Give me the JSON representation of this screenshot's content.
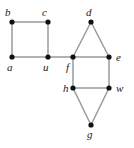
{
  "figure": {
    "name": "undirected-graph-diagram",
    "background_color": "#ffffff",
    "edge_color": "#9a9a9a",
    "vertex_color": "#111111",
    "label_color": "#1a1a1a",
    "vertex_radius": 2.6,
    "width": 134,
    "height": 148
  },
  "chart_data": {
    "type": "diagram",
    "title": "",
    "graph": {
      "kind": "undirected",
      "vertex_count": 9,
      "edge_count": 11,
      "vertices": [
        {
          "id": "a",
          "label": "a",
          "x": 12,
          "y": 57,
          "label_x": 7,
          "label_y": 62,
          "label_anchor": "below-left"
        },
        {
          "id": "b",
          "label": "b",
          "x": 12,
          "y": 22,
          "label_x": 5,
          "label_y": 7,
          "label_anchor": "above-left"
        },
        {
          "id": "c",
          "label": "c",
          "x": 48,
          "y": 22,
          "label_x": 42,
          "label_y": 7,
          "label_anchor": "above-left"
        },
        {
          "id": "u",
          "label": "u",
          "x": 48,
          "y": 57,
          "label_x": 43,
          "label_y": 62,
          "label_anchor": "below-left"
        },
        {
          "id": "f",
          "label": "f",
          "x": 73,
          "y": 57,
          "label_x": 66,
          "label_y": 62,
          "label_anchor": "below-left"
        },
        {
          "id": "d",
          "label": "d",
          "x": 91,
          "y": 22,
          "label_x": 86,
          "label_y": 7,
          "label_anchor": "above"
        },
        {
          "id": "e",
          "label": "e",
          "x": 109,
          "y": 57,
          "label_x": 116,
          "label_y": 52,
          "label_anchor": "right"
        },
        {
          "id": "h",
          "label": "h",
          "x": 73,
          "y": 88,
          "label_x": 63,
          "label_y": 83,
          "label_anchor": "left"
        },
        {
          "id": "w",
          "label": "w",
          "x": 109,
          "y": 88,
          "label_x": 116,
          "label_y": 83,
          "label_anchor": "right"
        },
        {
          "id": "g",
          "label": "g",
          "x": 91,
          "y": 125,
          "label_x": 87,
          "label_y": 129,
          "label_anchor": "below"
        }
      ],
      "edges": [
        {
          "from": "a",
          "to": "b"
        },
        {
          "from": "b",
          "to": "c"
        },
        {
          "from": "c",
          "to": "u"
        },
        {
          "from": "a",
          "to": "u"
        },
        {
          "from": "u",
          "to": "f"
        },
        {
          "from": "f",
          "to": "d"
        },
        {
          "from": "d",
          "to": "e"
        },
        {
          "from": "f",
          "to": "e"
        },
        {
          "from": "f",
          "to": "h"
        },
        {
          "from": "e",
          "to": "w"
        },
        {
          "from": "h",
          "to": "w"
        },
        {
          "from": "h",
          "to": "g"
        },
        {
          "from": "g",
          "to": "w"
        }
      ]
    }
  }
}
